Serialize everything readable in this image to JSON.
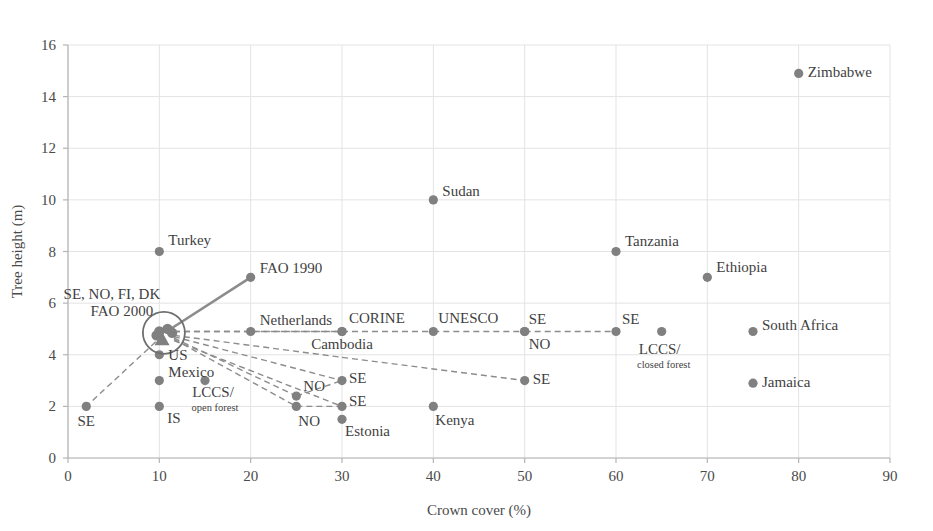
{
  "chart_data": {
    "type": "scatter",
    "title": "",
    "xlabel": "Crown cover (%)",
    "ylabel": "Tree height (m)",
    "xlim": [
      0,
      90
    ],
    "ylim": [
      0,
      16
    ],
    "xticks": [
      0,
      10,
      20,
      30,
      40,
      50,
      60,
      70,
      80,
      90
    ],
    "yticks": [
      0,
      2,
      4,
      6,
      8,
      10,
      12,
      14,
      16
    ],
    "xtick_labels": [
      "0",
      "10",
      "20",
      "30",
      "40",
      "50",
      "60",
      "70",
      "80",
      "90"
    ],
    "ytick_labels": [
      "0",
      "2",
      "4",
      "6",
      "8",
      "10",
      "12",
      "14",
      "16"
    ],
    "grid": true,
    "legend": "none",
    "marker_color": "#808080",
    "line_color": "#8c8c8c",
    "grid_color": "#e3e3e3",
    "axis_color": "#b5b5b5",
    "points": [
      {
        "label": "Zimbabwe",
        "x": 80,
        "y": 14.9,
        "label_dx": 9,
        "label_dy": 4,
        "anchor": "start"
      },
      {
        "label": "Sudan",
        "x": 40,
        "y": 10.0,
        "label_dx": 9,
        "label_dy": -4,
        "anchor": "start"
      },
      {
        "label": "Turkey",
        "x": 10,
        "y": 8.0,
        "label_dx": 9,
        "label_dy": -7,
        "anchor": "start"
      },
      {
        "label": "Tanzania",
        "x": 60,
        "y": 8.0,
        "label_dx": 9,
        "label_dy": -6,
        "anchor": "start"
      },
      {
        "label": "Ethiopia",
        "x": 70,
        "y": 7.0,
        "label_dx": 9,
        "label_dy": -5,
        "anchor": "start"
      },
      {
        "label": "FAO 1990",
        "x": 20,
        "y": 7.0,
        "label_dx": 9,
        "label_dy": -4,
        "anchor": "start"
      },
      {
        "label": "Netherlands",
        "x": 20,
        "y": 4.9,
        "label_dx": 9,
        "label_dy": -7,
        "anchor": "start"
      },
      {
        "label": "CORINE",
        "x": 30,
        "y": 4.9,
        "label_dx": 7,
        "label_dy": -9,
        "anchor": "start"
      },
      {
        "label": "Cambodia",
        "x": 30,
        "y": 4.9,
        "label_dx": 0,
        "label_dy": 17,
        "anchor": "middle"
      },
      {
        "label": "UNESCO",
        "x": 40,
        "y": 4.9,
        "label_dx": 5,
        "label_dy": -9,
        "anchor": "start"
      },
      {
        "label": "SE",
        "x": 50,
        "y": 4.9,
        "label_dx": 4,
        "label_dy": -8,
        "anchor": "start"
      },
      {
        "label": "NO",
        "x": 50,
        "y": 4.9,
        "label_dx": 4,
        "label_dy": 17,
        "anchor": "start"
      },
      {
        "label": "SE",
        "x": 60,
        "y": 4.9,
        "label_dx": 6,
        "label_dy": -8,
        "anchor": "start"
      },
      {
        "label": "South Africa",
        "x": 75,
        "y": 4.9,
        "label_dx": 9,
        "label_dy": -2,
        "anchor": "start"
      },
      {
        "label": "Jamaica",
        "x": 75,
        "y": 2.9,
        "label_dx": 9,
        "label_dy": 4,
        "anchor": "start"
      },
      {
        "label": "SE",
        "x": 50,
        "y": 3.0,
        "label_dx": 8,
        "label_dy": 3,
        "anchor": "start"
      },
      {
        "label": "Kenya",
        "x": 40,
        "y": 2.0,
        "label_dx": 2,
        "label_dy": 19,
        "anchor": "start"
      },
      {
        "label": "US",
        "x": 10,
        "y": 4.0,
        "label_dx": 9,
        "label_dy": 5,
        "anchor": "start"
      },
      {
        "label": "Mexico",
        "x": 10,
        "y": 3.0,
        "label_dx": 9,
        "label_dy": -4,
        "anchor": "start"
      },
      {
        "label": "IS",
        "x": 10,
        "y": 2.0,
        "label_dx": 8,
        "label_dy": 17,
        "anchor": "start"
      },
      {
        "label": "SE",
        "x": 2,
        "y": 2.0,
        "label_dx": 0,
        "label_dy": 20,
        "anchor": "middle"
      },
      {
        "label": "NO",
        "x": 25,
        "y": 2.4,
        "label_dx": 7,
        "label_dy": -5,
        "anchor": "start"
      },
      {
        "label": "NO",
        "x": 25,
        "y": 2.0,
        "label_dx": 2,
        "label_dy": 20,
        "anchor": "start"
      },
      {
        "label": "SE",
        "x": 30,
        "y": 3.0,
        "label_dx": 7,
        "label_dy": 2,
        "anchor": "start"
      },
      {
        "label": "SE",
        "x": 30,
        "y": 2.0,
        "label_dx": 7,
        "label_dy": 0,
        "anchor": "start"
      },
      {
        "label": "Estonia",
        "x": 30,
        "y": 1.5,
        "label_dx": 3,
        "label_dy": 17,
        "anchor": "start"
      }
    ],
    "multiline_points": [
      {
        "line1": "LCCS/",
        "line2": "open forest",
        "x": 15,
        "y": 3.0,
        "l1_dx": 8,
        "l1_dy": 16,
        "l2_dx": 10,
        "l2_dy": 30
      },
      {
        "line1": "LCCS/",
        "line2": "closed forest",
        "x": 65,
        "y": 4.9,
        "l1_dx": -2,
        "l1_dy": 22,
        "l2_dx": 2,
        "l2_dy": 36
      }
    ],
    "cluster": {
      "label_line1": "SE, NO, FI, DK",
      "label_line2": "FAO 2000",
      "x": 10.5,
      "y": 4.85,
      "circle_radius_px": 21,
      "label1_dx": -52,
      "label1_dy": -34,
      "label2_dx": -42,
      "label2_dy": -17,
      "members": [
        {
          "x": 10.0,
          "y": 4.9,
          "shape": "circle"
        },
        {
          "x": 10.9,
          "y": 5.0,
          "shape": "circle"
        },
        {
          "x": 11.4,
          "y": 4.85,
          "shape": "circle"
        },
        {
          "x": 10.3,
          "y": 4.6,
          "shape": "triangle"
        },
        {
          "x": 9.7,
          "y": 4.75,
          "shape": "circle"
        }
      ]
    },
    "solid_lines": [
      {
        "from_x": 10.8,
        "from_y": 4.9,
        "to_x": 20,
        "to_y": 7.0,
        "name": "fao-1990-connector"
      }
    ],
    "dashed_lines": [
      {
        "from_x": 11.6,
        "from_y": 4.9,
        "to_x": 20,
        "to_y": 4.9,
        "name": "connector-netherlands"
      },
      {
        "from_x": 11.6,
        "from_y": 4.9,
        "to_x": 30,
        "to_y": 4.9,
        "name": "connector-corine"
      },
      {
        "from_x": 20,
        "from_y": 4.9,
        "to_x": 30,
        "to_y": 4.9,
        "name": "row5-a"
      },
      {
        "from_x": 30,
        "from_y": 4.9,
        "to_x": 40,
        "to_y": 4.9,
        "name": "row5-b"
      },
      {
        "from_x": 40,
        "from_y": 4.9,
        "to_x": 50,
        "to_y": 4.9,
        "name": "row5-c"
      },
      {
        "from_x": 50,
        "from_y": 4.9,
        "to_x": 60,
        "to_y": 4.9,
        "name": "row5-d"
      },
      {
        "from_x": 11.6,
        "from_y": 4.75,
        "to_x": 30,
        "to_y": 3.9,
        "name": "connector-cambodia"
      },
      {
        "from_x": 30,
        "from_y": 3.9,
        "to_x": 50,
        "to_y": 3.0,
        "name": "connector-se-50"
      },
      {
        "from_x": 11.6,
        "from_y": 4.7,
        "to_x": 30,
        "to_y": 3.0,
        "name": "connector-se-30a"
      },
      {
        "from_x": 11.6,
        "from_y": 4.65,
        "to_x": 25,
        "to_y": 2.4,
        "name": "connector-no-25a"
      },
      {
        "from_x": 11.6,
        "from_y": 4.6,
        "to_x": 25,
        "to_y": 2.0,
        "name": "connector-no-25b"
      },
      {
        "from_x": 11.6,
        "from_y": 4.55,
        "to_x": 30,
        "to_y": 2.0,
        "name": "connector-se-30b"
      },
      {
        "from_x": 25,
        "from_y": 2.4,
        "to_x": 30,
        "to_y": 3.0,
        "name": "connector-no-se"
      },
      {
        "from_x": 25,
        "from_y": 2.0,
        "to_x": 30,
        "to_y": 2.0,
        "name": "connector-no-se2"
      },
      {
        "from_x": 9.6,
        "from_y": 4.5,
        "to_x": 2,
        "to_y": 2.0,
        "name": "connector-se-2"
      }
    ]
  }
}
